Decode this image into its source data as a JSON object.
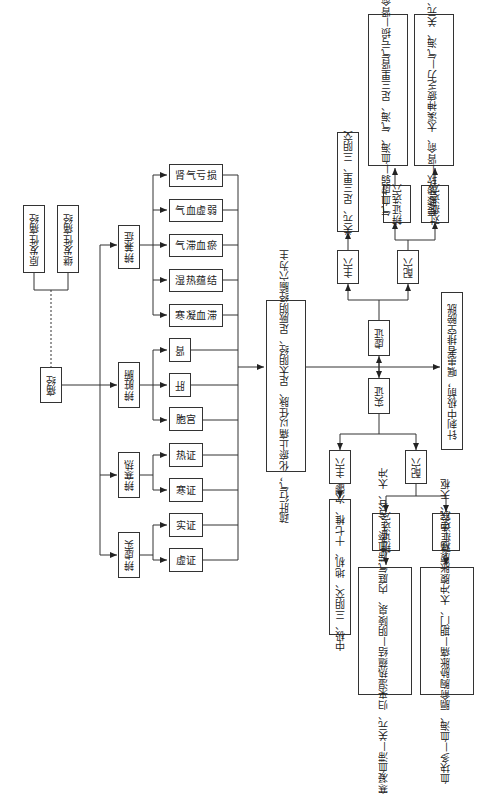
{
  "diagram": {
    "orientation": "rotated 90° counter-clockwise (text reads bottom-to-top)",
    "root": {
      "label": "痛经"
    },
    "types": [
      {
        "label": "原发性痛经"
      },
      {
        "label": "继发性痛经"
      }
    ],
    "differentiation": [
      {
        "label": "辨兼症",
        "children": [
          "肾气亏损",
          "气血虚弱",
          "气滞血瘀",
          "湿热蕴结",
          "寒凝血滞"
        ]
      },
      {
        "label": "辨脏腑",
        "children": [
          "肾",
          "肝",
          "胞宫"
        ]
      },
      {
        "label": "辨寒热",
        "children": [
          "热证",
          "寒证"
        ]
      },
      {
        "label": "辨虚实",
        "children": [
          "实证",
          "虚证"
        ]
      }
    ],
    "principle": {
      "line1": "疏肝行气，化瘀止痛",
      "line2": "以任脉、足太阴经、足厥阴经腧穴为主"
    },
    "deficiency": {
      "label": "虚证",
      "main_points": {
        "label": "主穴",
        "content": "关元、足三里、三阴交"
      },
      "supplementary": {
        "label": "配穴",
        "syndrome": {
          "label_line1": "辨证",
          "label_line2": "选穴",
          "content": [
            "气血虚弱—血海、气海、足三里",
            "肾气亏损—肾俞、太溪"
          ]
        },
        "symptom": {
          "label_line1": "对症",
          "label_line2": "选穴",
          "content": [
            "腰膝酸软—肾俞、太溪",
            "神疲乏力—气海、关元、足三里"
          ]
        }
      }
    },
    "excess": {
      "label": "实证",
      "main_points": {
        "label": "主穴",
        "content": "中极、三阴交、地机、十七椎、次髎"
      },
      "supplementary": {
        "label": "配穴",
        "syndrome": {
          "label_line1": "辨证",
          "label_line2": "选穴",
          "content": [
            "寒凝血滞—关元、归来",
            "湿热蕴结—阴陵泉、内庭",
            "气滞血瘀—合谷、太冲"
          ]
        },
        "symptom": {
          "label_line1": "对症",
          "label_line2": "选穴",
          "content": [
            "血块多—血海、膈俞",
            "胸胁胀痛—期门、太冲",
            "腹胀腹痛—中脘、天枢"
          ]
        }
      }
    },
    "note": "针刺中极前，嘱患者排空膀胱"
  }
}
